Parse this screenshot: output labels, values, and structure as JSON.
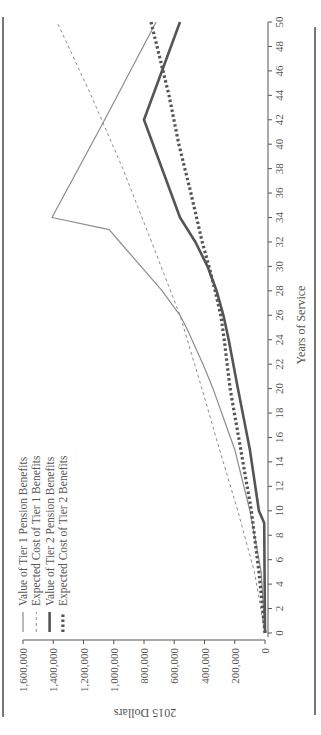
{
  "chart_data": {
    "type": "line",
    "orientation": "figure rotated 90 degrees counter-clockwise",
    "title": "",
    "xlabel": "Years of Service",
    "ylabel": "2015 Dollars",
    "xlim": [
      0,
      50
    ],
    "ylim": [
      0,
      1600000
    ],
    "x_ticks": [
      "0",
      "2",
      "4",
      "6",
      "8",
      "10",
      "12",
      "14",
      "16",
      "18",
      "20",
      "22",
      "24",
      "26",
      "28",
      "30",
      "32",
      "34",
      "36",
      "38",
      "40",
      "42",
      "44",
      "46",
      "48",
      "50"
    ],
    "y_ticks": [
      "0",
      "200,000",
      "400,000",
      "600,000",
      "800,000",
      "1,000,000",
      "1,200,000",
      "1,400,000",
      "1,600,000"
    ],
    "grid": false,
    "legend_position": "upper left (inside plot)",
    "series": [
      {
        "name": "Value of Tier 1 Pension Benefits",
        "style": "solid-thin",
        "color": "#8c8c8c",
        "x": [
          0,
          5,
          10,
          15,
          20,
          22,
          25,
          26,
          28,
          30,
          32,
          33,
          34,
          42,
          50
        ],
        "values": [
          0,
          25000,
          100000,
          200000,
          344000,
          410000,
          520000,
          562000,
          680000,
          820000,
          960000,
          1030000,
          1408000,
          1060000,
          720000
        ]
      },
      {
        "name": "Expected Cost of Tier 1 Benefits",
        "style": "dashed-thin",
        "color": "#8c8c8c",
        "x": [
          0,
          5,
          10,
          15,
          20,
          26,
          32,
          38,
          44,
          50
        ],
        "values": [
          0,
          70000,
          180000,
          300000,
          417000,
          562000,
          750000,
          940000,
          1150000,
          1375000
        ]
      },
      {
        "name": "Value of Tier 2 Pension Benefits",
        "style": "solid-thick",
        "color": "#555555",
        "x": [
          0,
          9,
          10,
          15,
          20,
          24,
          26,
          28,
          30,
          32,
          34,
          42,
          50
        ],
        "values": [
          0,
          5000,
          40000,
          100000,
          179000,
          240000,
          275000,
          320000,
          380000,
          460000,
          562000,
          800000,
          562000
        ]
      },
      {
        "name": "Expected Cost of Tier 2 Benefits",
        "style": "dotted-thick",
        "color": "#555555",
        "x": [
          0,
          5,
          10,
          15,
          20,
          24,
          26,
          28,
          30,
          32,
          36,
          40,
          44,
          50
        ],
        "values": [
          0,
          40000,
          90000,
          160000,
          231000,
          270000,
          292000,
          330000,
          370000,
          415000,
          490000,
          570000,
          635000,
          754000
        ]
      }
    ]
  },
  "legend": {
    "items": [
      {
        "label": "Value of Tier 1 Pension Benefits"
      },
      {
        "label": "Expected Cost of Tier 1 Benefits"
      },
      {
        "label": "Value of Tier 2 Pension Benefits"
      },
      {
        "label": "Expected Cost of Tier 2 Benefits"
      }
    ]
  },
  "axes": {
    "x_title": "Years of Service",
    "y_title": "2015 Dollars"
  }
}
